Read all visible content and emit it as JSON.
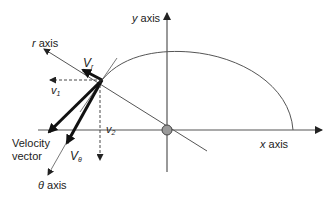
{
  "diagram": {
    "type": "polar coordinate velocity decomposition",
    "labels": {
      "y_axis_var": "y",
      "y_axis_word": " axis",
      "x_axis_var": "x",
      "x_axis_word": " axis",
      "r_axis_var": "r",
      "r_axis_word": " axis",
      "theta_axis_var": "θ",
      "theta_axis_word": " axis",
      "v_r_main": "V",
      "v_r_sub": "r",
      "v_theta_main": "V",
      "v_theta_sub": "θ",
      "v1_main": "v",
      "v1_sub": "1",
      "v2_main": "v",
      "v2_sub": "2",
      "velocity_line1": "Velocity",
      "velocity_line2": "vector"
    },
    "colors": {
      "line": "#222222",
      "thin_line": "#555555",
      "origin_fill": "#9a9a9a",
      "background": "#ffffff"
    }
  }
}
